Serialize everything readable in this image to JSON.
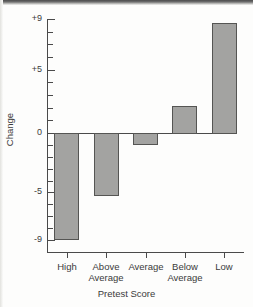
{
  "chart_data": {
    "type": "bar",
    "title": "",
    "subtitle": "",
    "xlabel": "Pretest Score",
    "ylabel": "Change",
    "categories": [
      "High",
      "Above\nAverage",
      "Average",
      "Below\nAverage",
      "Low"
    ],
    "category_labels_flat": [
      "High",
      "Above Average",
      "Average",
      "Below Average",
      "Low"
    ],
    "values": [
      -9.0,
      -5.3,
      -1.0,
      2.1,
      8.7
    ],
    "series": [
      {
        "name": "Change",
        "values": [
          -9.0,
          -5.3,
          -1.0,
          2.1,
          8.7
        ]
      }
    ],
    "ylim": [
      -9.6,
      9.6
    ],
    "ytick_values": [
      9,
      8,
      7,
      6,
      5,
      4,
      3,
      2,
      1,
      0,
      -1,
      -2,
      -3,
      -4,
      -5,
      -6,
      -7,
      -8,
      -9
    ],
    "ytick_labeled": [
      {
        "value": 9,
        "label": "+9"
      },
      {
        "value": 5,
        "label": "+5"
      },
      {
        "value": 0,
        "label": "0"
      },
      {
        "value": -5,
        "label": "-5"
      },
      {
        "value": -9,
        "label": "-9"
      }
    ],
    "grid": false,
    "legend": null,
    "legend_position": "none",
    "baseline": 0,
    "bar_color": "#a3a3a1",
    "bar_edge_color": "#555553",
    "axis_color": "#4a4a4a",
    "text_color": "#3b3b3b",
    "background_color": "#fdfdfc",
    "annotations": []
  },
  "axis": {
    "y_title": "Change",
    "x_title": "Pretest Score"
  },
  "ticks": {
    "y_labels": [
      "+9",
      "+5",
      "0",
      "-5",
      "-9"
    ],
    "x_labels": [
      "High",
      "Above\nAverage",
      "Average",
      "Below\nAverage",
      "Low"
    ]
  }
}
